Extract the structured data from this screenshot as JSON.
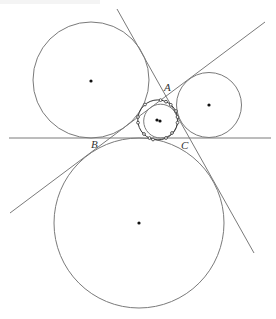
{
  "diagram": {
    "stroke_color": "#7a7a7a",
    "dot_color": "#111111",
    "labels": {
      "A": "A",
      "B": "B",
      "C": "C"
    },
    "vertices": {
      "A": [
        166,
        96
      ],
      "B": [
        110,
        138
      ],
      "C": [
        189,
        138
      ]
    },
    "lines": [
      {
        "name": "line-BC",
        "from": [
          9,
          138
        ],
        "to": [
          271,
          138
        ]
      },
      {
        "name": "line-AB",
        "from": [
          10,
          213
        ],
        "to": [
          265,
          22
        ]
      },
      {
        "name": "line-AC",
        "from": [
          117,
          9
        ],
        "to": [
          254,
          253
        ]
      }
    ],
    "circles": [
      {
        "name": "excircle-C",
        "cx": 91,
        "cy": 80,
        "r": 58
      },
      {
        "name": "excircle-B",
        "cx": 209,
        "cy": 105,
        "r": 32.5
      },
      {
        "name": "excircle-A",
        "cx": 139,
        "cy": 223,
        "r": 85
      },
      {
        "name": "incircle",
        "cx": 160.6,
        "cy": 121.1,
        "r": 16.9
      },
      {
        "name": "nine-point-circle",
        "cx": 157.8,
        "cy": 119.9,
        "r": 20
      }
    ],
    "centers": [
      [
        91,
        81
      ],
      [
        209,
        105
      ],
      [
        139,
        223
      ],
      [
        160,
        121
      ],
      [
        157,
        120
      ]
    ],
    "nine_point_marks": [
      [
        149.5,
        138
      ],
      [
        177.5,
        117
      ],
      [
        138,
        117
      ],
      [
        166,
        138
      ],
      [
        170.8,
        104.8
      ],
      [
        160.6,
        100.1
      ],
      [
        166,
        101.7
      ],
      [
        138,
        122.7
      ],
      [
        177.5,
        122.7
      ],
      [
        145,
        104.5
      ],
      [
        144,
        134
      ],
      [
        172,
        133
      ],
      [
        153,
        139.5
      ],
      [
        176,
        111
      ]
    ]
  }
}
